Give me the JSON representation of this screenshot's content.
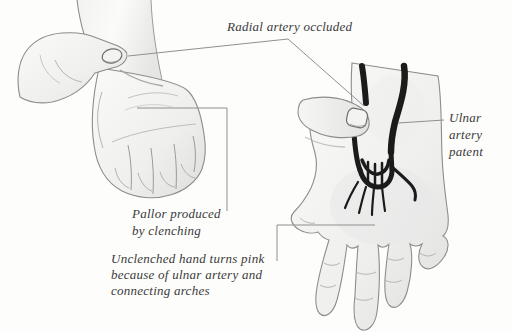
{
  "figure": {
    "type": "medical-illustration-allen-test",
    "background_color": "#fdfdfc",
    "labels": {
      "radial": "Radial artery occluded",
      "ulnar": "Ulnar\nartery\npatent",
      "pallor": "Pallor produced\nby clenching",
      "unclenched": "Unclenched hand turns pink\nbecause of ulnar artery and\nconnecting arches"
    },
    "colors": {
      "artery": "#1b1b1b",
      "leader_line": "#8f8f8f",
      "text": "#3a3a3a",
      "hand_outline": "#8d8d8d",
      "hand_fill_light": "#f8f8f7",
      "hand_fill_shade": "#dededd"
    },
    "illustrations": {
      "left": "clenched-fist-with-examiner-thumb-compressing-wrist",
      "right": "open-hand-with-dark-ulnar-artery-and-palmar-arches"
    }
  }
}
